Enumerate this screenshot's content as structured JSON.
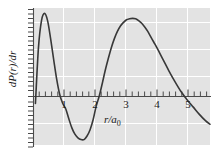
{
  "figure": {
    "background": "#ffffff",
    "panel_background": "#e3e3e3",
    "gridline_color": "#ffffff",
    "axis_color": "#4a4a4a",
    "curve_color": "#383838"
  },
  "chart_data": {
    "type": "line",
    "title": "",
    "subtitle": "",
    "xlabel": "r/a0",
    "xlabel_parts": {
      "main": "r/a",
      "sub": "0"
    },
    "ylabel": "dP(r)/dr",
    "xlim": [
      -0.08,
      5.75
    ],
    "ylim": [
      -0.46,
      1.06
    ],
    "grid": true,
    "gridlines_x": [
      1,
      2,
      3,
      4,
      5
    ],
    "gridlines_y": [
      -0.3,
      0.0,
      0.3,
      0.6,
      0.9
    ],
    "legend": "none",
    "xticks_major": [
      1,
      2,
      3,
      4,
      5
    ],
    "xtick_labels": [
      "1",
      "2",
      "3",
      "4",
      "5"
    ],
    "xticks_minor_step": 0.2,
    "yticks_minor_step": 0.05,
    "zero_line": 0,
    "annotations": [],
    "series": [
      {
        "name": "dP(r)/dr",
        "color": "#383838",
        "x": [
          0.0,
          0.1,
          0.2,
          0.3,
          0.4,
          0.5,
          0.6,
          0.7,
          0.8,
          0.9,
          1.0,
          1.1,
          1.2,
          1.3,
          1.4,
          1.5,
          1.6,
          1.7,
          1.8,
          1.9,
          2.0,
          2.1,
          2.2,
          2.3,
          2.4,
          2.5,
          2.6,
          2.7,
          2.8,
          2.9,
          3.0,
          3.1,
          3.2,
          3.3,
          3.4,
          3.5,
          3.6,
          3.7,
          3.8,
          3.9,
          4.0,
          4.2,
          4.4,
          4.6,
          4.8,
          5.0,
          5.2,
          5.4,
          5.6,
          5.75
        ],
        "y": [
          0.0,
          0.62,
          0.92,
          1.0,
          0.92,
          0.72,
          0.49,
          0.27,
          0.1,
          0.0,
          -0.06,
          -0.17,
          -0.27,
          -0.34,
          -0.38,
          -0.4,
          -0.4,
          -0.36,
          -0.29,
          -0.18,
          -0.03,
          0.08,
          0.22,
          0.37,
          0.5,
          0.62,
          0.72,
          0.8,
          0.86,
          0.9,
          0.93,
          0.94,
          0.945,
          0.94,
          0.92,
          0.89,
          0.85,
          0.8,
          0.74,
          0.68,
          0.62,
          0.49,
          0.36,
          0.24,
          0.13,
          0.04,
          -0.04,
          -0.12,
          -0.19,
          -0.23
        ],
        "markers": false,
        "linewidth": 1.6
      }
    ],
    "key_features": {
      "first_maximum_r": 0.5,
      "first_node_r": 0.95,
      "minimum_r": 1.6,
      "second_node_r": 2.05,
      "second_maximum_r": 3.2,
      "third_node_r": 5.1
    }
  }
}
